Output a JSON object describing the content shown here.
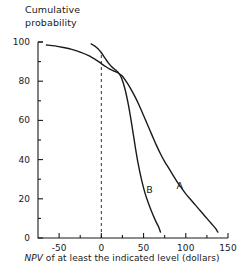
{
  "figure": {
    "width": 244,
    "height": 280,
    "background": "#ffffff",
    "ink_color": "#1a1a1a"
  },
  "axes": {
    "y_title_line1": "Cumulative",
    "y_title_line2": "probability",
    "x_title_italic": "NPV",
    "x_title_rest": " of at least the indicated level (dollars)",
    "y_ticks_major": [
      "0",
      "20",
      "40",
      "60",
      "80",
      "100"
    ],
    "x_ticks_major": [
      "-50",
      "0",
      "50",
      "100",
      "150"
    ]
  },
  "chart_data": {
    "type": "line",
    "title": "",
    "subtitle": "",
    "xlabel": "NPV of at least the indicated level (dollars)",
    "ylabel": "Cumulative probability",
    "xlim": [
      -75,
      150
    ],
    "ylim": [
      0,
      100
    ],
    "x_ticks": [
      -50,
      0,
      50,
      100,
      150
    ],
    "x_minor_ticks": [
      -25,
      25,
      75,
      125
    ],
    "y_ticks": [
      0,
      20,
      40,
      60,
      80,
      100
    ],
    "y_minor_ticks": [
      10,
      30,
      50,
      70,
      90
    ],
    "grid": false,
    "legend": "inline-labels",
    "annotations": [
      {
        "text": "A",
        "x": 93,
        "y": 27
      },
      {
        "text": "B",
        "x": 57,
        "y": 25
      }
    ],
    "reference_lines": [
      {
        "orientation": "vertical",
        "x": 0,
        "style": "dashed",
        "y_from": 0,
        "y_to": 95
      }
    ],
    "series": [
      {
        "name": "A",
        "label": "A",
        "style": "solid",
        "points": [
          [
            -65,
            98.5
          ],
          [
            -55,
            98.0
          ],
          [
            -45,
            97.2
          ],
          [
            -35,
            96.2
          ],
          [
            -25,
            94.8
          ],
          [
            -15,
            93.0
          ],
          [
            -5,
            90.5
          ],
          [
            0,
            89.0
          ],
          [
            5,
            87.5
          ],
          [
            10,
            86.2
          ],
          [
            15,
            85.2
          ],
          [
            20,
            84.2
          ],
          [
            25,
            82.5
          ],
          [
            30,
            79.5
          ],
          [
            35,
            76.0
          ],
          [
            40,
            72.0
          ],
          [
            45,
            67.5
          ],
          [
            50,
            62.5
          ],
          [
            55,
            57.5
          ],
          [
            60,
            52.5
          ],
          [
            65,
            47.5
          ],
          [
            70,
            43.0
          ],
          [
            75,
            39.0
          ],
          [
            80,
            35.5
          ],
          [
            85,
            32.0
          ],
          [
            90,
            28.5
          ],
          [
            95,
            25.5
          ],
          [
            100,
            22.5
          ],
          [
            105,
            20.0
          ],
          [
            110,
            17.5
          ],
          [
            115,
            15.0
          ],
          [
            120,
            12.5
          ],
          [
            125,
            10.0
          ],
          [
            130,
            7.5
          ],
          [
            135,
            5.0
          ],
          [
            138,
            3.0
          ]
        ]
      },
      {
        "name": "B",
        "label": "B",
        "style": "solid",
        "points": [
          [
            -12,
            99.0
          ],
          [
            -8,
            98.0
          ],
          [
            -4,
            96.5
          ],
          [
            0,
            94.5
          ],
          [
            4,
            92.0
          ],
          [
            8,
            89.5
          ],
          [
            12,
            87.5
          ],
          [
            16,
            86.0
          ],
          [
            20,
            84.5
          ],
          [
            24,
            81.5
          ],
          [
            28,
            76.0
          ],
          [
            32,
            68.0
          ],
          [
            36,
            58.0
          ],
          [
            40,
            47.0
          ],
          [
            44,
            37.0
          ],
          [
            48,
            29.0
          ],
          [
            52,
            22.5
          ],
          [
            56,
            17.5
          ],
          [
            60,
            13.0
          ],
          [
            64,
            9.0
          ],
          [
            68,
            5.5
          ],
          [
            70,
            3.0
          ]
        ]
      }
    ]
  }
}
